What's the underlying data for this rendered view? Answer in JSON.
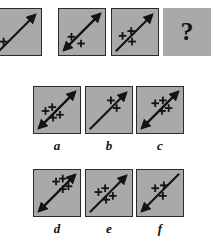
{
  "puzzle": {
    "type": "matrix-reasoning",
    "question_mark": "?",
    "sequence": [
      {
        "id": "q1",
        "name": "question-panel-1",
        "arrow": {
          "direction": "up-right",
          "heads": [
            "end"
          ]
        },
        "plus_count": 1,
        "plus_positions": [
          {
            "x": 9,
            "y": 34
          }
        ]
      },
      {
        "id": "q2",
        "name": "question-panel-2",
        "arrow": {
          "direction": "up-right",
          "heads": [
            "start",
            "end"
          ]
        },
        "plus_count": 2,
        "plus_positions": [
          {
            "x": 13,
            "y": 29
          },
          {
            "x": 23,
            "y": 36
          }
        ]
      },
      {
        "id": "q3",
        "name": "question-panel-3",
        "arrow": {
          "direction": "up-right",
          "heads": [
            "end"
          ]
        },
        "plus_count": 3,
        "plus_positions": [
          {
            "x": 11,
            "y": 28
          },
          {
            "x": 20,
            "y": 23
          },
          {
            "x": 21,
            "y": 34
          }
        ]
      },
      {
        "id": "q4",
        "name": "question-panel-unknown",
        "arrow": null,
        "plus_count": null,
        "plus_positions": []
      }
    ],
    "options": [
      {
        "id": "a",
        "label": "a",
        "arrow": {
          "direction": "up-right",
          "heads": [
            "start",
            "end"
          ]
        },
        "plus_count": 4,
        "plus_positions": [
          {
            "x": 12,
            "y": 25
          },
          {
            "x": 19,
            "y": 21
          },
          {
            "x": 20,
            "y": 32
          },
          {
            "x": 27,
            "y": 29
          }
        ]
      },
      {
        "id": "b",
        "label": "b",
        "arrow": {
          "direction": "up-right",
          "heads": [
            "end"
          ]
        },
        "plus_count": 2,
        "plus_positions": [
          {
            "x": 26,
            "y": 14
          },
          {
            "x": 32,
            "y": 22
          }
        ]
      },
      {
        "id": "c",
        "label": "c",
        "arrow": {
          "direction": "up-right",
          "heads": [
            "start",
            "end"
          ]
        },
        "plus_count": 4,
        "plus_positions": [
          {
            "x": 19,
            "y": 17
          },
          {
            "x": 27,
            "y": 14
          },
          {
            "x": 26,
            "y": 25
          },
          {
            "x": 33,
            "y": 22
          }
        ]
      },
      {
        "id": "d",
        "label": "d",
        "arrow": {
          "direction": "up-right",
          "heads": [
            "start",
            "end"
          ]
        },
        "plus_count": 4,
        "plus_positions": [
          {
            "x": 23,
            "y": 12
          },
          {
            "x": 30,
            "y": 9
          },
          {
            "x": 30,
            "y": 20
          },
          {
            "x": 36,
            "y": 17
          }
        ]
      },
      {
        "id": "e",
        "label": "e",
        "arrow": {
          "direction": "up-right",
          "heads": [
            "end"
          ]
        },
        "plus_count": 4,
        "plus_positions": [
          {
            "x": 13,
            "y": 23
          },
          {
            "x": 20,
            "y": 19
          },
          {
            "x": 21,
            "y": 31
          },
          {
            "x": 28,
            "y": 27
          }
        ]
      },
      {
        "id": "f",
        "label": "f",
        "arrow": {
          "direction": "up-right",
          "heads": [
            "start"
          ]
        },
        "plus_count": 3,
        "plus_positions": [
          {
            "x": 19,
            "y": 19
          },
          {
            "x": 28,
            "y": 16
          },
          {
            "x": 27,
            "y": 27
          }
        ]
      }
    ]
  },
  "colors": {
    "tile_fill": "#a9a9a9",
    "tile_border": "#2b2b2b",
    "ink": "#141414",
    "page_background": "#ffffff"
  }
}
